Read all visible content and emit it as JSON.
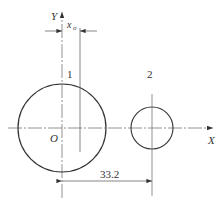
{
  "diagram": {
    "labels": {
      "y_axis": "Y",
      "x_axis": "X",
      "origin": "O",
      "x0": "x",
      "x0_sub": "o",
      "circle1": "1",
      "circle2": "2",
      "dimension": "33.2"
    },
    "colors": {
      "line": "#333333",
      "center": "#888888"
    }
  }
}
